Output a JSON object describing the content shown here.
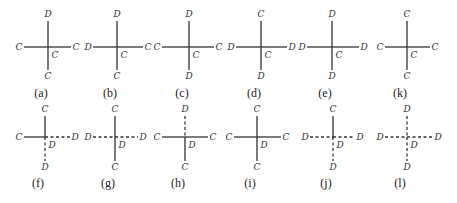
{
  "figure": {
    "rows": [
      {
        "y_center": 47,
        "y_top_label": 17,
        "y_bottom_label": 79,
        "y_caption": 97,
        "items": [
          {
            "id": "a",
            "caption": "(a)",
            "x": 48,
            "left_x": 19,
            "right_x": 76,
            "top": "D",
            "left": "C",
            "right": "C",
            "bottom": "C",
            "center": "C",
            "dashed": {
              "top": false,
              "left": false,
              "right": false,
              "bottom": false
            }
          },
          {
            "id": "b",
            "caption": "(b)",
            "x": 117,
            "left_x": 88,
            "right_x": 148,
            "top": "D",
            "left": "D",
            "right": "C",
            "bottom": "C",
            "center": "C",
            "dashed": {
              "top": false,
              "left": false,
              "right": false,
              "bottom": false
            }
          },
          {
            "id": "c",
            "caption": "(c)",
            "x": 189,
            "left_x": 157,
            "right_x": 219,
            "top": "D",
            "left": "C",
            "right": "C",
            "bottom": "D",
            "center": "C",
            "dashed": {
              "top": false,
              "left": false,
              "right": false,
              "bottom": false
            }
          },
          {
            "id": "d",
            "caption": "(d)",
            "x": 261,
            "left_x": 231,
            "right_x": 292,
            "top": "C",
            "left": "D",
            "right": "D",
            "bottom": "D",
            "center": "C",
            "dashed": {
              "top": false,
              "left": false,
              "right": false,
              "bottom": false
            }
          },
          {
            "id": "e",
            "caption": "(e)",
            "x": 332,
            "left_x": 302,
            "right_x": 364,
            "top": "D",
            "left": "D",
            "right": "D",
            "bottom": "D",
            "center": "C",
            "dashed": {
              "top": false,
              "left": false,
              "right": false,
              "bottom": false
            }
          },
          {
            "id": "k",
            "caption": "(k)",
            "x": 407,
            "left_x": 380,
            "right_x": 435,
            "top": "C",
            "left": "C",
            "right": "C",
            "bottom": "C",
            "center": "C",
            "dashed": {
              "top": false,
              "left": false,
              "right": false,
              "bottom": false
            }
          }
        ]
      },
      {
        "y_center": 137,
        "y_top_label": 112,
        "y_bottom_label": 170,
        "y_caption": 187,
        "items": [
          {
            "id": "f",
            "caption": "(f)",
            "x": 45,
            "left_x": 19,
            "right_x": 75,
            "top": "C",
            "left": "C",
            "right": "D",
            "bottom": "D",
            "center": "D",
            "dashed": {
              "top": false,
              "left": false,
              "right": true,
              "bottom": true
            }
          },
          {
            "id": "g",
            "caption": "(g)",
            "x": 115,
            "left_x": 88,
            "right_x": 143,
            "top": "C",
            "left": "D",
            "right": "D",
            "bottom": "C",
            "center": "D",
            "dashed": {
              "top": false,
              "left": true,
              "right": true,
              "bottom": false
            }
          },
          {
            "id": "h",
            "caption": "(h)",
            "x": 185,
            "left_x": 157,
            "right_x": 213,
            "top": "D",
            "left": "C",
            "right": "C",
            "bottom": "C",
            "center": "D",
            "dashed": {
              "top": true,
              "left": false,
              "right": false,
              "bottom": false
            }
          },
          {
            "id": "i",
            "caption": "(i)",
            "x": 257,
            "left_x": 229,
            "right_x": 286,
            "top": "C",
            "left": "C",
            "right": "C",
            "bottom": "C",
            "center": "D",
            "dashed": {
              "top": false,
              "left": false,
              "right": false,
              "bottom": false
            }
          },
          {
            "id": "j",
            "caption": "(j)",
            "x": 333,
            "left_x": 305,
            "right_x": 360,
            "top": "C",
            "left": "D",
            "right": "D",
            "bottom": "D",
            "center": "D",
            "dashed": {
              "top": false,
              "left": true,
              "right": true,
              "bottom": true
            }
          },
          {
            "id": "l",
            "caption": "(l)",
            "x": 407,
            "left_x": 380,
            "right_x": 438,
            "top": "D",
            "left": "D",
            "right": "D",
            "bottom": "D",
            "center": "D",
            "dashed": {
              "top": true,
              "left": true,
              "right": true,
              "bottom": true
            }
          }
        ]
      }
    ],
    "colors": {
      "line": "#333333",
      "text": "#333333",
      "background": "#ffffff"
    }
  }
}
